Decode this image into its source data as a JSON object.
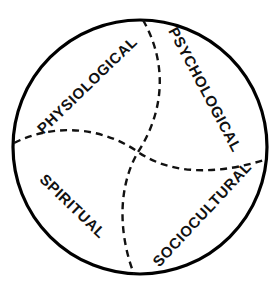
{
  "diagram": {
    "type": "venn-pinwheel-circle",
    "shape": "circle",
    "background_color": "#ffffff",
    "outline_color": "#000000",
    "divider_color": "#111111",
    "divider_style": "dashed",
    "circle": {
      "center_x": 140,
      "center_y": 147,
      "radius": 127
    },
    "quadrants": [
      {
        "id": "physiological",
        "label": "PHYSIOLOGICAL",
        "position": "upper-left",
        "text_x": 88,
        "text_y": 86,
        "rotation_deg": -44,
        "font_size": 15
      },
      {
        "id": "psychological",
        "label": "PSYCHOLOGICAL",
        "position": "upper-right",
        "text_x": 204,
        "text_y": 90,
        "rotation_deg": 62,
        "font_size": 15
      },
      {
        "id": "spiritual",
        "label": "SPIRITUAL",
        "position": "lower-left",
        "text_x": 72,
        "text_y": 207,
        "rotation_deg": 44,
        "font_size": 15
      },
      {
        "id": "sociocultural",
        "label": "SOCIOCULTURAL",
        "position": "lower-right",
        "text_x": 203,
        "text_y": 215,
        "rotation_deg": -47,
        "font_size": 15
      }
    ],
    "dividers": [
      {
        "id": "vertical-divider",
        "from": "top",
        "to": "bottom",
        "path": "M 143 20 C 168 64 164 112 138 152 C 116 190 120 238 134 274"
      },
      {
        "id": "horizontal-divider",
        "from": "left",
        "to": "right",
        "path": "M 14 143 C 56 122 104 128 138 152 C 176 178 226 172 264 160"
      }
    ]
  }
}
